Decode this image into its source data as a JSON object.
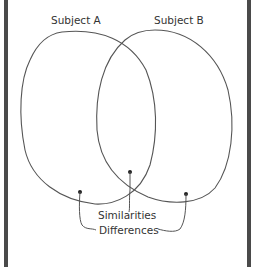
{
  "diagram": {
    "type": "venn",
    "sets": [
      {
        "label": "Subject A"
      },
      {
        "label": "Subject B"
      }
    ],
    "annotations": {
      "similarities": "Similarities",
      "differences": "Differences"
    },
    "colors": {
      "stroke": "#555555",
      "border": "#4a4a4a",
      "background": "#ffffff"
    }
  }
}
